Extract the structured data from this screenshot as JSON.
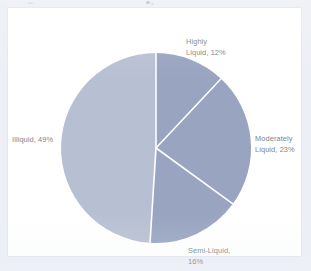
{
  "page": {
    "background_color": "#eceff5",
    "panel_background_color": "#ffffff",
    "panel_border_color": "#e3e7ef"
  },
  "chart_data": {
    "type": "pie",
    "title": "",
    "subtitle": "",
    "xlabel": "",
    "ylabel": "",
    "legend_position": "none",
    "labels_position": "outside",
    "grid": false,
    "start_angle_deg": 0,
    "direction": "clockwise",
    "categories": [
      "Highly Liquid",
      "Moderately Liquid",
      "Semi-Liquid",
      "Illiquid"
    ],
    "values": [
      12,
      23,
      16,
      49
    ],
    "unit": "%",
    "colors": [
      "#98a4c0",
      "#98a4c0",
      "#98a4c0",
      "#b7bfd2"
    ],
    "divider_color": "#ffffff",
    "slices": [
      {
        "name": "Highly Liquid",
        "value": 12,
        "label": "Highly\nLiquid, 12%",
        "color": "#98a4c0",
        "start_deg": 0,
        "end_deg": 43.2
      },
      {
        "name": "Moderately Liquid",
        "value": 23,
        "label": "Moderately\nLiquid, 23%",
        "color": "#98a4c0",
        "start_deg": 43.2,
        "end_deg": 126.0
      },
      {
        "name": "Semi-Liquid",
        "value": 16,
        "label": "Semi-Liquid,\n16%",
        "color": "#98a4c0",
        "start_deg": 126.0,
        "end_deg": 183.6
      },
      {
        "name": "Illiquid",
        "value": 49,
        "label": "Illiquid, 49%",
        "color": "#b7bfd2",
        "start_deg": 183.6,
        "end_deg": 360.0
      }
    ]
  }
}
